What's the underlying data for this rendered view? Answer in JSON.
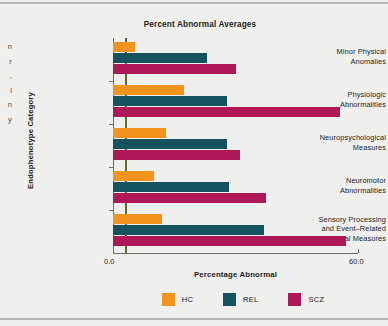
{
  "page": {
    "margin_text_lines": [
      "n",
      "r",
      ",",
      "l",
      "n",
      "y"
    ]
  },
  "chart_data": {
    "type": "bar",
    "orientation": "horizontal",
    "title": "Percent Abnormal Averages",
    "xlabel": "Percentage Abnormal",
    "ylabel": "Endophenotype Category",
    "xlim": [
      0.0,
      60.0
    ],
    "xticks": [
      0.0,
      60.0
    ],
    "xtick_labels": [
      "0.0",
      "60.0"
    ],
    "grid": false,
    "legend_position": "bottom",
    "reference_line": 3.0,
    "reference_line_color": "#5e6b29",
    "categories": [
      "Minor Physical Anomalies",
      "Physiologic Abnormalities",
      "Neuropsychological Measures",
      "Neuromotor Abnormalities",
      "Sensory Processing and Event–Related Potential Measures"
    ],
    "category_lines": [
      [
        "Minor Physical",
        "Anomalies"
      ],
      [
        "Physiologic",
        "Abnormalities"
      ],
      [
        "Neuropsychological",
        "Measures"
      ],
      [
        "Neuromotor",
        "Abnormalities"
      ],
      [
        "Sensory Processing",
        "and Event–Related",
        "Potential Measures"
      ]
    ],
    "series": [
      {
        "name": "HC",
        "color": "#f2931e",
        "values": [
          5.5,
          17.5,
          13.0,
          10.0,
          12.0
        ]
      },
      {
        "name": "REL",
        "color": "#14525e",
        "values": [
          23.0,
          28.0,
          28.0,
          28.5,
          37.0
        ]
      },
      {
        "name": "SCZ",
        "color": "#ae1857",
        "values": [
          30.0,
          55.5,
          31.0,
          37.5,
          57.0
        ]
      }
    ],
    "legend": [
      {
        "label": "HC",
        "color": "#f2931e"
      },
      {
        "label": "REL",
        "color": "#14525e"
      },
      {
        "label": "SCZ",
        "color": "#ae1857"
      }
    ]
  }
}
